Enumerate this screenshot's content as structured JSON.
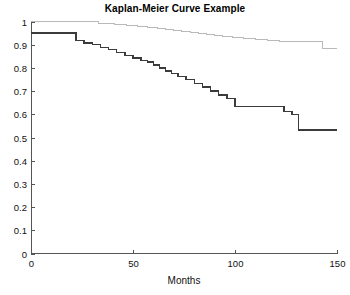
{
  "chart_data": {
    "type": "line",
    "title": "Kaplan-Meier Curve Example",
    "xlabel": "Months",
    "ylabel": "",
    "xlim": [
      0,
      150
    ],
    "ylim": [
      0,
      1
    ],
    "xticks": [
      0,
      50,
      100,
      150
    ],
    "xtick_labels": [
      "0",
      "50",
      "100",
      "150"
    ],
    "yticks": [
      0,
      0.1,
      0.2,
      0.3,
      0.4,
      0.5,
      0.6,
      0.7,
      0.8,
      0.9,
      1
    ],
    "ytick_labels": [
      "0",
      "0.1",
      "0.2",
      "0.3",
      "0.4",
      "0.5",
      "0.6",
      "0.7",
      "0.8",
      "0.9",
      "1"
    ],
    "grid": false,
    "legend": false,
    "step_type": "post",
    "series": [
      {
        "name": "upper-curve",
        "color": "#b9b9b9",
        "stroke_width": 1,
        "x": [
          0,
          28,
          33,
          41,
          47,
          52,
          57,
          62,
          66,
          70,
          74,
          78,
          82,
          86,
          90,
          94,
          99,
          104,
          110,
          116,
          122,
          128,
          134,
          140,
          143,
          150
        ],
        "y": [
          1.0,
          1.0,
          0.993,
          0.987,
          0.983,
          0.978,
          0.974,
          0.969,
          0.965,
          0.96,
          0.956,
          0.951,
          0.947,
          0.943,
          0.938,
          0.934,
          0.93,
          0.925,
          0.921,
          0.917,
          0.913,
          0.913,
          0.913,
          0.913,
          0.883,
          0.883
        ]
      },
      {
        "name": "lower-curve",
        "color": "#3b3b3b",
        "stroke_width": 1.4,
        "x": [
          0,
          15,
          22,
          26,
          30,
          34,
          38,
          42,
          46,
          50,
          54,
          57,
          60,
          63,
          66,
          69,
          72,
          76,
          80,
          84,
          88,
          92,
          96,
          100,
          104,
          108,
          112,
          116,
          120,
          124,
          128,
          131,
          150
        ],
        "y": [
          0.95,
          0.95,
          0.917,
          0.908,
          0.9,
          0.887,
          0.879,
          0.866,
          0.854,
          0.842,
          0.833,
          0.825,
          0.812,
          0.8,
          0.787,
          0.775,
          0.762,
          0.75,
          0.733,
          0.717,
          0.7,
          0.683,
          0.667,
          0.633,
          0.633,
          0.633,
          0.633,
          0.633,
          0.633,
          0.612,
          0.6,
          0.533,
          0.533
        ]
      }
    ]
  },
  "figure": {
    "background_color": "#ffffff",
    "axis_color": "#555555",
    "text_color": "#111111"
  }
}
